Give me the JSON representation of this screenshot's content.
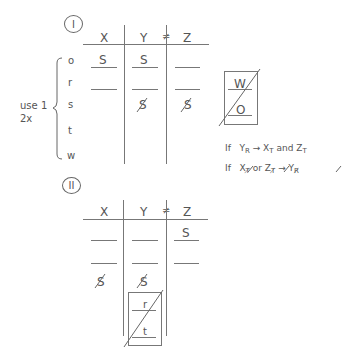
{
  "section1": {
    "label": "I",
    "headers": [
      "X",
      "Y",
      "≠",
      "Z"
    ],
    "row_labels": [
      "o",
      "r",
      "s",
      "t",
      "w"
    ],
    "brace_note": [
      "use 1",
      "2x"
    ],
    "cells": {
      "o": {
        "X": "S",
        "Y": "S",
        "Z": ""
      },
      "r": {
        "X": "",
        "Y": "",
        "Z": ""
      },
      "s": {
        "Y": "S",
        "Z": "S"
      }
    },
    "struck_cells": [
      "s.Y",
      "s.Z"
    ],
    "side_box": {
      "top": "W",
      "bottom": "O",
      "crossed_out": true
    },
    "rules": [
      {
        "prefix": "If",
        "a": "Y",
        "a_sub": "R",
        "arrow": "→",
        "b": "X",
        "b_sub": "T",
        "joiner": "and",
        "c": "Z",
        "c_sub": "T"
      },
      {
        "prefix": "If",
        "a": "X",
        "a_sub": "T̸",
        "joiner": "or",
        "b": "Z",
        "b_sub": "T̸",
        "arrow": "→",
        "c": "Y",
        "c_sub": "R̸"
      }
    ]
  },
  "section2": {
    "label": "II",
    "headers": [
      "X",
      "Y",
      "≠",
      "Z"
    ],
    "cells": {
      "row1": {
        "X": "",
        "Y": "",
        "Z": "S"
      },
      "row2": {
        "X": "",
        "Y": "",
        "Z": ""
      },
      "row3": {
        "X": "S",
        "Y": "S"
      }
    },
    "struck_cells": [
      "row3.X",
      "row3.Y"
    ],
    "sub_box": {
      "top": "r",
      "bottom": "t",
      "crossed_out": true
    }
  }
}
